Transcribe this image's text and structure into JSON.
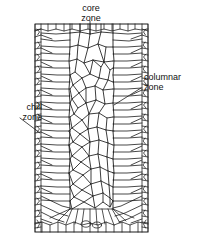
{
  "figure": {
    "name": "ingot-grain-structure",
    "caption": "",
    "background_color": "#ffffff",
    "line_color": "#1a1a1a",
    "text_color": "#111111"
  },
  "labels": {
    "core": {
      "line1": "core",
      "line2": "zone",
      "full": "core zone"
    },
    "columnar": {
      "line1": "columnar",
      "line2": "zone",
      "full": "columnar zone"
    },
    "chill": {
      "line1": "chill",
      "line2": "zone",
      "full": "chill zone"
    }
  },
  "diagram": {
    "frame": {
      "x": 35,
      "y": 24,
      "width": 113,
      "height": 208
    },
    "zones": [
      {
        "id": "chill-left",
        "name": "chill zone",
        "description": "thin band of fine equiaxed grains along the left mould wall"
      },
      {
        "id": "chill-right",
        "name": "chill zone",
        "description": "thin band of fine equiaxed grains along the right mould wall"
      },
      {
        "id": "columnar-left",
        "name": "columnar zone",
        "description": "elongated grains growing inward from the left chill layer"
      },
      {
        "id": "columnar-right",
        "name": "columnar zone",
        "description": "elongated grains growing inward from the right chill layer"
      },
      {
        "id": "core",
        "name": "core zone",
        "description": "central band of coarse equiaxed polygonal grains"
      },
      {
        "id": "chill-bottom",
        "name": "chill zone",
        "description": "fine grains along the bottom mould wall"
      }
    ],
    "leaders": [
      {
        "id": "core-leader",
        "from": [
          90,
          22
        ],
        "to": [
          90,
          34
        ]
      },
      {
        "id": "columnar-leader",
        "from": [
          142,
          88
        ],
        "to": [
          114,
          105
        ]
      },
      {
        "id": "chill-leader",
        "from": [
          20,
          118
        ],
        "to": [
          40,
          133
        ]
      }
    ]
  }
}
